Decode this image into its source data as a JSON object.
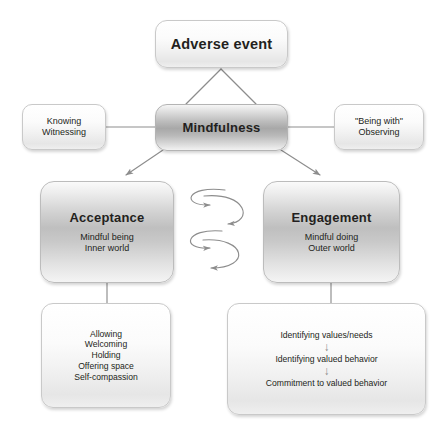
{
  "diagram": {
    "type": "flowchart",
    "line_color": "#8c8c8c",
    "text_color": "#231f20",
    "nodes": {
      "adverse_event": {
        "label": "Adverse event"
      },
      "mindfulness": {
        "label": "Mindfulness"
      },
      "knowing": {
        "line1": "Knowing",
        "line2": "Witnessing"
      },
      "being_with": {
        "line1": "\"Being with\"",
        "line2": "Observing"
      },
      "acceptance": {
        "title": "Acceptance",
        "line1": "Mindful being",
        "line2": "Inner world"
      },
      "engagement": {
        "title": "Engagement",
        "line1": "Mindful doing",
        "line2": "Outer world"
      },
      "acceptance_practices": {
        "items": [
          "Allowing",
          "Welcoming",
          "Holding",
          "Offering space",
          "Self-compassion"
        ]
      },
      "engagement_practices": {
        "steps": [
          "Identifying values/needs",
          "Identifying valued behavior",
          "Commitment to valued behavior"
        ],
        "arrow_glyph": "↓"
      }
    },
    "connectors": {
      "adverse_to_mindfulness": "v-split line",
      "knowing_to_mindfulness": "plain line",
      "mindfulness_to_being_with": "plain line",
      "mindfulness_to_acceptance": "arrow",
      "mindfulness_to_engagement": "arrow",
      "acceptance_to_practices": "plain line",
      "engagement_to_practices": "plain line",
      "acceptance_engagement_interplay": "double squiggle with arrows both directions"
    }
  }
}
